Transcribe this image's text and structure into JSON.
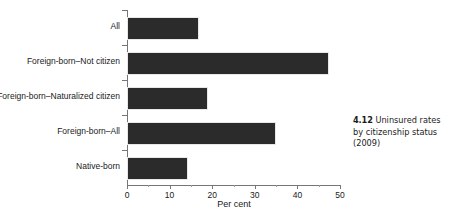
{
  "chart_data": {
    "type": "bar",
    "orientation": "horizontal",
    "title": "",
    "xlabel": "Per cent",
    "ylabel": "",
    "xlim": [
      0,
      50
    ],
    "xticks": [
      0,
      10,
      20,
      30,
      40,
      50
    ],
    "xtick_labels": [
      "0",
      "10",
      "20",
      "30",
      "40",
      "50"
    ],
    "grid": false,
    "legend": null,
    "categories": [
      "All",
      "Foreign-born–Not citizen",
      "Foreign-born–Naturalized citizen",
      "Foreign-born–All",
      "Native-born"
    ],
    "values": [
      16.5,
      47.0,
      18.5,
      34.5,
      13.8
    ],
    "bar_color": "#2b2b2b",
    "axis_color": "#767676"
  },
  "caption": {
    "number": "4.12",
    "text": "Uninsured rates by citizenship status (2009)"
  }
}
